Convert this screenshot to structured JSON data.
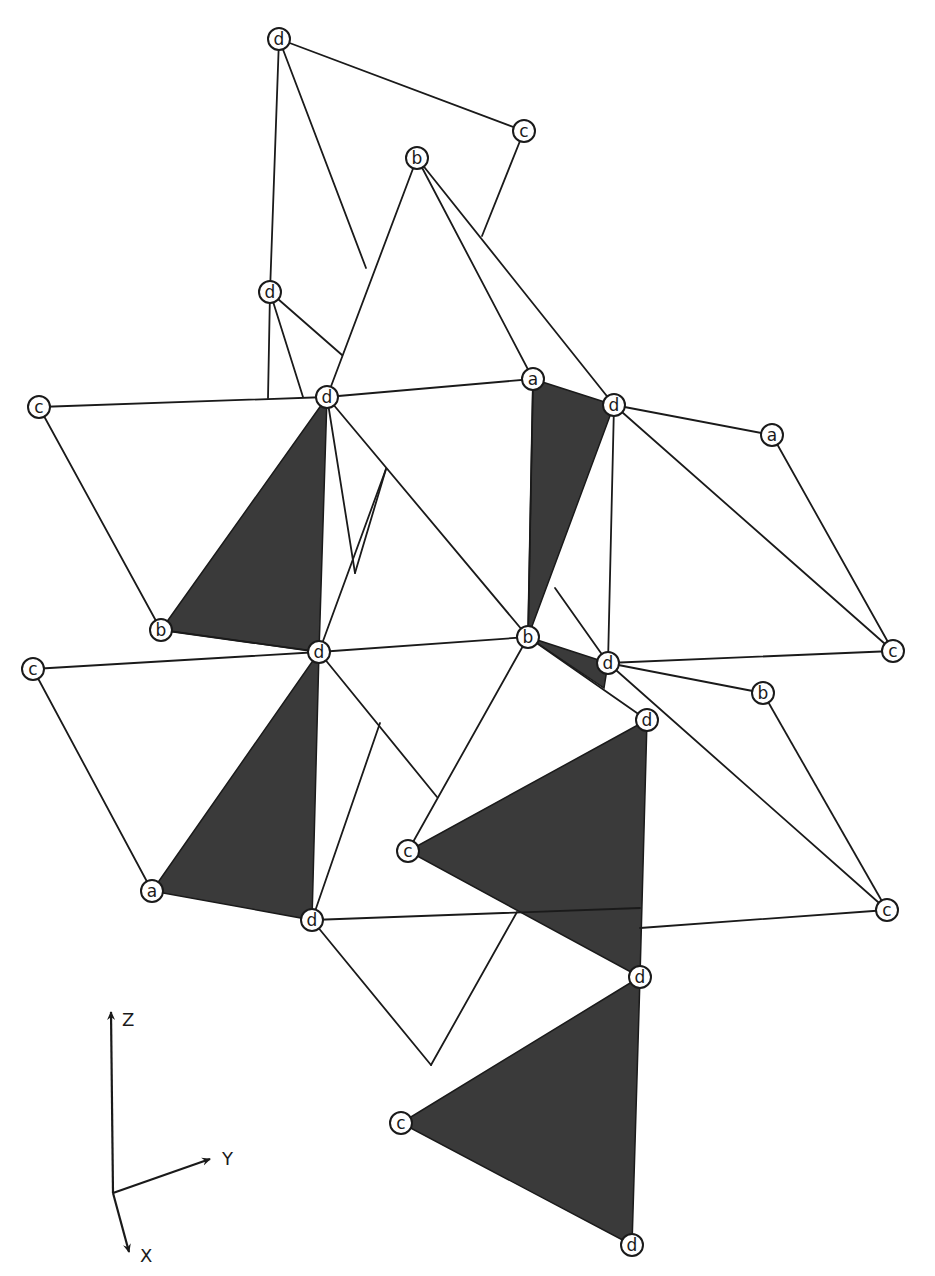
{
  "diagram": {
    "type": "crystal-structure-polyhedra",
    "colors": {
      "line": "#1a1a1a",
      "shaded_face": "#3a3a3a",
      "background": "#ffffff"
    },
    "nodes": [
      {
        "id": "n1",
        "label": "d",
        "x": 279,
        "y": 39
      },
      {
        "id": "n2",
        "label": "c",
        "x": 524,
        "y": 131
      },
      {
        "id": "n3",
        "label": "b",
        "x": 417,
        "y": 158
      },
      {
        "id": "n4",
        "label": "d",
        "x": 270,
        "y": 292
      },
      {
        "id": "n5",
        "label": "a",
        "x": 533,
        "y": 379
      },
      {
        "id": "n6",
        "label": "c",
        "x": 39,
        "y": 407
      },
      {
        "id": "n7",
        "label": "d",
        "x": 327,
        "y": 397
      },
      {
        "id": "n8",
        "label": "d",
        "x": 614,
        "y": 405
      },
      {
        "id": "n9",
        "label": "a",
        "x": 772,
        "y": 435
      },
      {
        "id": "n10",
        "label": "b",
        "x": 161,
        "y": 630
      },
      {
        "id": "n11",
        "label": "b",
        "x": 528,
        "y": 637
      },
      {
        "id": "n12",
        "label": "d",
        "x": 319,
        "y": 652
      },
      {
        "id": "n13",
        "label": "d",
        "x": 608,
        "y": 663
      },
      {
        "id": "n14",
        "label": "c",
        "x": 893,
        "y": 651
      },
      {
        "id": "n15",
        "label": "c",
        "x": 33,
        "y": 669
      },
      {
        "id": "n16",
        "label": "b",
        "x": 763,
        "y": 693
      },
      {
        "id": "n17",
        "label": "d",
        "x": 647,
        "y": 720
      },
      {
        "id": "n18",
        "label": "c",
        "x": 408,
        "y": 851
      },
      {
        "id": "n19",
        "label": "a",
        "x": 152,
        "y": 891
      },
      {
        "id": "n20",
        "label": "d",
        "x": 312,
        "y": 920
      },
      {
        "id": "n21",
        "label": "c",
        "x": 887,
        "y": 910
      },
      {
        "id": "n22",
        "label": "d",
        "x": 640,
        "y": 977
      },
      {
        "id": "n23",
        "label": "c",
        "x": 401,
        "y": 1123
      },
      {
        "id": "n24",
        "label": "d",
        "x": 632,
        "y": 1245
      }
    ],
    "edges": [
      [
        279,
        39,
        524,
        131
      ],
      [
        279,
        39,
        270,
        292
      ],
      [
        279,
        39,
        366,
        268
      ],
      [
        524,
        131,
        482,
        236
      ],
      [
        417,
        158,
        327,
        397
      ],
      [
        417,
        158,
        533,
        379
      ],
      [
        417,
        158,
        614,
        405
      ],
      [
        270,
        292,
        268,
        398
      ],
      [
        270,
        292,
        303,
        397
      ],
      [
        270,
        292,
        342,
        355
      ],
      [
        39,
        407,
        327,
        397
      ],
      [
        39,
        407,
        161,
        630
      ],
      [
        327,
        397,
        533,
        379
      ],
      [
        327,
        397,
        528,
        637
      ],
      [
        327,
        397,
        355,
        573
      ],
      [
        533,
        379,
        528,
        637
      ],
      [
        614,
        405,
        772,
        435
      ],
      [
        614,
        405,
        893,
        651
      ],
      [
        614,
        405,
        608,
        663
      ],
      [
        772,
        435,
        893,
        651
      ],
      [
        355,
        573,
        386,
        469
      ],
      [
        386,
        469,
        319,
        652
      ],
      [
        161,
        630,
        319,
        652
      ],
      [
        319,
        652,
        528,
        637
      ],
      [
        33,
        669,
        319,
        652
      ],
      [
        33,
        669,
        152,
        891
      ],
      [
        528,
        637,
        647,
        720
      ],
      [
        528,
        637,
        408,
        851
      ],
      [
        555,
        588,
        608,
        663
      ],
      [
        608,
        663,
        893,
        651
      ],
      [
        608,
        663,
        763,
        693
      ],
      [
        608,
        663,
        887,
        910
      ],
      [
        763,
        693,
        887,
        910
      ],
      [
        319,
        652,
        437,
        797
      ],
      [
        380,
        723,
        312,
        920
      ],
      [
        312,
        920,
        640,
        908
      ],
      [
        640,
        928,
        887,
        910
      ],
      [
        312,
        920,
        431,
        1065
      ],
      [
        431,
        1065,
        517,
        912
      ]
    ],
    "shaded_faces": [
      [
        [
          327,
          397
        ],
        [
          161,
          630
        ],
        [
          319,
          652
        ]
      ],
      [
        [
          533,
          379
        ],
        [
          614,
          405
        ],
        [
          528,
          637
        ]
      ],
      [
        [
          528,
          637
        ],
        [
          608,
          663
        ],
        [
          604,
          688
        ]
      ],
      [
        [
          319,
          652
        ],
        [
          152,
          891
        ],
        [
          312,
          920
        ]
      ],
      [
        [
          647,
          720
        ],
        [
          408,
          851
        ],
        [
          640,
          977
        ]
      ],
      [
        [
          640,
          977
        ],
        [
          401,
          1123
        ],
        [
          632,
          1245
        ]
      ]
    ],
    "axes": {
      "origin": {
        "x": 113,
        "y": 1193
      },
      "z": {
        "label": "Z",
        "x": 111,
        "y": 1012,
        "label_x": 122,
        "label_y": 1026
      },
      "y": {
        "label": "Y",
        "x": 210,
        "y": 1159,
        "label_x": 222,
        "label_y": 1165
      },
      "x": {
        "label": "X",
        "x": 129,
        "y": 1252,
        "label_x": 140,
        "label_y": 1262
      }
    }
  }
}
